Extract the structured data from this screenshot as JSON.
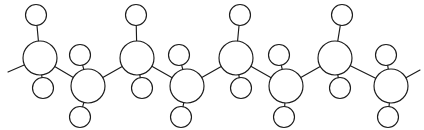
{
  "diagram": {
    "canvas": {
      "width": 424,
      "height": 130,
      "background": "#ffffff"
    },
    "style": {
      "bond_color": "#1b1b1b",
      "bond_width": 1.15,
      "atom_fill": "#ffffff",
      "atom_stroke": "#1b1b1b",
      "backbone_radius": 17,
      "pendant_radius": 10.5
    },
    "backbone_atoms": [
      {
        "id": "C1",
        "label": "",
        "cx": 40,
        "cy": 58,
        "r": 17,
        "row": "upper"
      },
      {
        "id": "C2",
        "label": "",
        "cx": 88,
        "cy": 86,
        "r": 17,
        "row": "lower"
      },
      {
        "id": "C3",
        "label": "",
        "cx": 137,
        "cy": 58,
        "r": 17,
        "row": "upper"
      },
      {
        "id": "C4",
        "label": "",
        "cx": 187,
        "cy": 86,
        "r": 17,
        "row": "lower"
      },
      {
        "id": "C5",
        "label": "",
        "cx": 236,
        "cy": 58,
        "r": 17,
        "row": "upper"
      },
      {
        "id": "C6",
        "label": "",
        "cx": 286,
        "cy": 86,
        "r": 17,
        "row": "lower"
      },
      {
        "id": "C7",
        "label": "",
        "cx": 335,
        "cy": 58,
        "r": 17,
        "row": "upper"
      },
      {
        "id": "C8",
        "label": "",
        "cx": 391,
        "cy": 86,
        "r": 17,
        "row": "lower"
      }
    ],
    "pendant_atoms": [
      {
        "id": "H1a",
        "label": "",
        "cx": 36,
        "cy": 15,
        "r": 10.5,
        "parent": "C1",
        "side": "up"
      },
      {
        "id": "H1b",
        "label": "",
        "cx": 43,
        "cy": 88,
        "r": 10.5,
        "parent": "C1",
        "side": "down"
      },
      {
        "id": "H2a",
        "label": "",
        "cx": 80,
        "cy": 55,
        "r": 10.5,
        "parent": "C2",
        "side": "up"
      },
      {
        "id": "H2b",
        "label": "",
        "cx": 80,
        "cy": 117,
        "r": 10.5,
        "parent": "C2",
        "side": "down"
      },
      {
        "id": "H3a",
        "label": "",
        "cx": 136,
        "cy": 15,
        "r": 10.5,
        "parent": "C3",
        "side": "up"
      },
      {
        "id": "H3b",
        "label": "",
        "cx": 142,
        "cy": 88,
        "r": 10.5,
        "parent": "C3",
        "side": "down"
      },
      {
        "id": "H4a",
        "label": "",
        "cx": 179,
        "cy": 55,
        "r": 10.5,
        "parent": "C4",
        "side": "up"
      },
      {
        "id": "H4b",
        "label": "",
        "cx": 181,
        "cy": 117,
        "r": 10.5,
        "parent": "C4",
        "side": "down"
      },
      {
        "id": "H5a",
        "label": "",
        "cx": 240,
        "cy": 15,
        "r": 10.5,
        "parent": "C5",
        "side": "up"
      },
      {
        "id": "H5b",
        "label": "",
        "cx": 241,
        "cy": 88,
        "r": 10.5,
        "parent": "C5",
        "side": "down"
      },
      {
        "id": "H6a",
        "label": "",
        "cx": 279,
        "cy": 55,
        "r": 10.5,
        "parent": "C6",
        "side": "up"
      },
      {
        "id": "H6b",
        "label": "",
        "cx": 284,
        "cy": 117,
        "r": 10.5,
        "parent": "C6",
        "side": "down"
      },
      {
        "id": "H7a",
        "label": "",
        "cx": 342,
        "cy": 15,
        "r": 10.5,
        "parent": "C7",
        "side": "up"
      },
      {
        "id": "H7b",
        "label": "",
        "cx": 340,
        "cy": 88,
        "r": 10.5,
        "parent": "C7",
        "side": "down"
      },
      {
        "id": "H8a",
        "label": "",
        "cx": 386,
        "cy": 55,
        "r": 10.5,
        "parent": "C8",
        "side": "up"
      },
      {
        "id": "H8b",
        "label": "",
        "cx": 388,
        "cy": 117,
        "r": 10.5,
        "parent": "C8",
        "side": "down"
      }
    ],
    "backbone_bonds": [
      {
        "id": "b-C1-C2",
        "from": "C1",
        "to": "C2"
      },
      {
        "id": "b-C2-C3",
        "from": "C2",
        "to": "C3"
      },
      {
        "id": "b-C3-C4",
        "from": "C3",
        "to": "C4"
      },
      {
        "id": "b-C4-C5",
        "from": "C4",
        "to": "C5"
      },
      {
        "id": "b-C5-C6",
        "from": "C5",
        "to": "C6"
      },
      {
        "id": "b-C6-C7",
        "from": "C6",
        "to": "C7"
      },
      {
        "id": "b-C7-C8",
        "from": "C7",
        "to": "C8"
      }
    ],
    "pendant_bonds": [
      {
        "id": "b-C1-H1a",
        "from": "C1",
        "to": "H1a"
      },
      {
        "id": "b-C1-H1b",
        "from": "C1",
        "to": "H1b"
      },
      {
        "id": "b-C2-H2a",
        "from": "C2",
        "to": "H2a"
      },
      {
        "id": "b-C2-H2b",
        "from": "C2",
        "to": "H2b"
      },
      {
        "id": "b-C3-H3a",
        "from": "C3",
        "to": "H3a"
      },
      {
        "id": "b-C3-H3b",
        "from": "C3",
        "to": "H3b"
      },
      {
        "id": "b-C4-H4a",
        "from": "C4",
        "to": "H4a"
      },
      {
        "id": "b-C4-H4b",
        "from": "C4",
        "to": "H4b"
      },
      {
        "id": "b-C5-H5a",
        "from": "C5",
        "to": "H5a"
      },
      {
        "id": "b-C5-H5b",
        "from": "C5",
        "to": "H5b"
      },
      {
        "id": "b-C6-H6a",
        "from": "C6",
        "to": "H6a"
      },
      {
        "id": "b-C6-H6b",
        "from": "C6",
        "to": "H6b"
      },
      {
        "id": "b-C7-H7a",
        "from": "C7",
        "to": "H7a"
      },
      {
        "id": "b-C7-H7b",
        "from": "C7",
        "to": "H7b"
      },
      {
        "id": "b-C8-H8a",
        "from": "C8",
        "to": "H8a"
      },
      {
        "id": "b-C8-H8b",
        "from": "C8",
        "to": "H8b"
      }
    ],
    "terminal_bonds": [
      {
        "id": "t-left",
        "from": "C1",
        "x2": 8,
        "y2": 72
      },
      {
        "id": "t-right",
        "from": "C8",
        "x2": 420,
        "y2": 70
      }
    ]
  }
}
